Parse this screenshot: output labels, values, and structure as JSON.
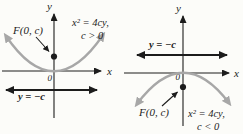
{
  "figure": {
    "colors": {
      "curve": "#a7a7a7",
      "curve_label": "#9c9c9c",
      "ink": "#1c1c1c"
    },
    "panels": [
      {
        "name": "parabola-opens-up",
        "equation_line1": "x² = 4cy,",
        "equation_line2": "c > 0",
        "focus_label": "F(0, c)",
        "directrix_label": "y = −c",
        "origin_label": "0",
        "x_axis_label": "x",
        "y_axis_label": "y"
      },
      {
        "name": "parabola-opens-down",
        "equation_line1": "x² = 4cy,",
        "equation_line2": "c < 0",
        "focus_label": "F(0, c)",
        "directrix_label": "y = −c",
        "origin_label": "0",
        "x_axis_label": "x",
        "y_axis_label": "y"
      }
    ]
  }
}
